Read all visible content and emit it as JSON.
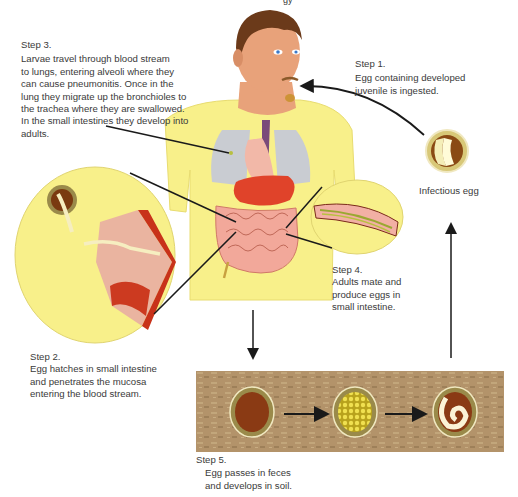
{
  "diagram": {
    "type": "life-cycle",
    "top_clipped_text": "gy"
  },
  "steps": [
    {
      "id": "step1",
      "heading": "Step 1.",
      "lines": [
        "Egg containing developed",
        "juvenile is ingested."
      ]
    },
    {
      "id": "step2",
      "heading": "Step 2.",
      "lines": [
        "Egg hatches in small intestine",
        "and penetrates the mucosa",
        "entering the blood stream."
      ]
    },
    {
      "id": "step3",
      "heading": "Step 3.",
      "lines": [
        "Larvae travel through blood stream",
        "to lungs, entering alveoli where they",
        "can cause pneumonitis.  Once in the",
        "lung they migrate up the bronchioles to",
        "the trachea where they are swallowed.",
        "In the small intestines they develop into",
        "adults."
      ]
    },
    {
      "id": "step4",
      "heading": "Step 4.",
      "lines": [
        "Adults mate and",
        "produce eggs in",
        "small intestine."
      ]
    },
    {
      "id": "step5",
      "heading": "Step 5.",
      "lines": [
        "Egg passes in feces",
        "and develops in soil."
      ]
    }
  ],
  "labels": {
    "infectious_egg": "Infectious egg"
  },
  "colors": {
    "body_yellow": "#f8f08a",
    "skin": "#e8a27a",
    "hair": "#6b3a1a",
    "lungs": "#c9ccd2",
    "stomach": "#e0432a",
    "intestine": "#f2a89a",
    "egg_shell": "#9a8a4a",
    "egg_brown": "#8a3a14",
    "egg_yolk": "#e8d830",
    "soil": "#b89a6a",
    "arrow": "#1a1a1a"
  }
}
